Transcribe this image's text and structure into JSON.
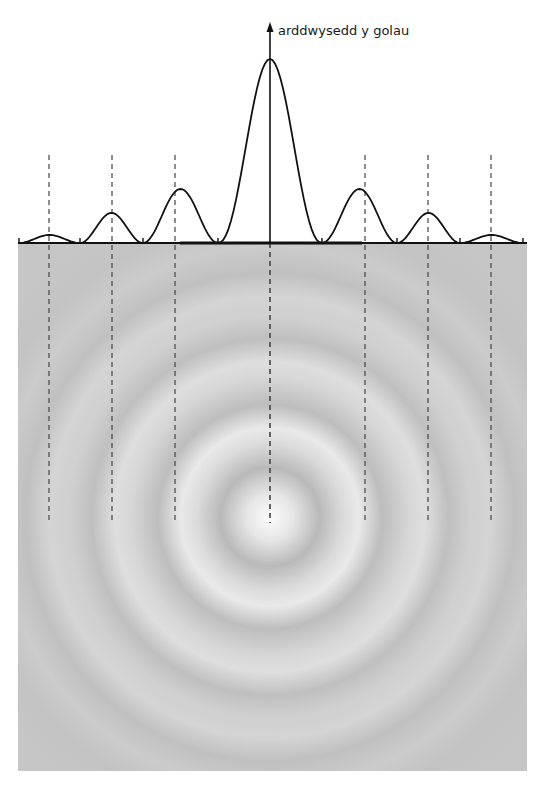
{
  "diagram": {
    "type": "airy-diffraction-pattern",
    "axis_label": "arddwysedd y golau",
    "colors": {
      "background": "#ffffff",
      "pattern_base": "#c4c4c4",
      "pattern_bright": "#f4f4f4",
      "pattern_dark": "#b2b2b2",
      "curve": "#111111",
      "dashed_lines": "#444444"
    },
    "geometry": {
      "center_x": 270,
      "baseline_y": 243,
      "arrow_tip_y": 23,
      "pattern_box": {
        "x": 18,
        "y": 244,
        "width": 509,
        "height": 527
      },
      "ring_center_y": 517,
      "dashed_top_y": 155,
      "dashed_bottom_y": 523
    },
    "intensity_profile": {
      "central_peak_y": 59,
      "side_peaks": [
        {
          "order": 1,
          "x_left": 175,
          "x_right": 365,
          "peak_y": 189
        },
        {
          "order": 2,
          "x_left": 112,
          "x_right": 428,
          "peak_y": 213
        },
        {
          "order": 3,
          "x_left": 49,
          "x_right": 491,
          "peak_y": 235
        }
      ],
      "zeros_x": [
        19,
        80,
        143,
        218,
        322,
        397,
        460,
        523
      ]
    },
    "dashed_lines_x": [
      49,
      112,
      175,
      270,
      365,
      428,
      491
    ]
  }
}
